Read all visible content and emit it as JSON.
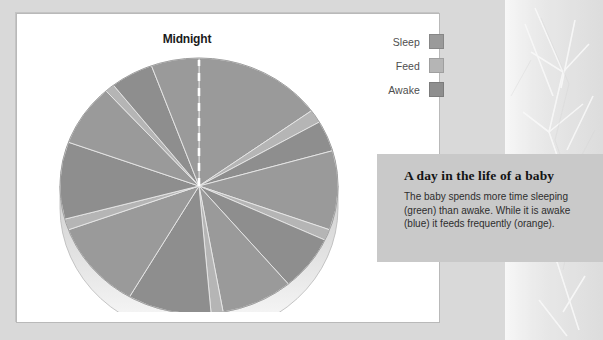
{
  "chart_panel": {
    "title": "Midnight"
  },
  "legend": {
    "items": [
      {
        "label": "Sleep",
        "color": "#9a9a9a",
        "icon": "legend-swatch-icon"
      },
      {
        "label": "Feed",
        "color": "#b5b5b5",
        "icon": "legend-swatch-icon"
      },
      {
        "label": "Awake",
        "color": "#8e8e8e",
        "icon": "legend-swatch-icon"
      }
    ]
  },
  "caption": {
    "title": "A day in the life of a baby",
    "body": "The baby spends more time sleeping (green) than awake. While it is awake (blue) it feeds frequently (orange)."
  },
  "colors": {
    "page_background": "#d9d9d9",
    "panel_background": "#ffffff",
    "panel_border": "#b9b9b9",
    "caption_background": "#c9c9c9",
    "sleep": "#9a9a9a",
    "feed": "#b5b5b5",
    "awake": "#8e8e8e",
    "pie_side": "#d4d4d4",
    "midnight_marker": "#ffffff",
    "text_dark": "#1b1b1b",
    "text_gray": "#4e4e4e"
  },
  "chart_data": {
    "type": "pie",
    "title": "Midnight",
    "subtitle": "A day in the life of a baby",
    "start_angle_deg": 0,
    "direction": "clockwise",
    "units": "hours of a 24 hour day",
    "total": 24,
    "annotations": [
      "Midnight"
    ],
    "legend_position": "top-right",
    "three_d": true,
    "categories": [
      "Sleep",
      "Feed",
      "Awake"
    ],
    "category_colors": [
      "#9a9a9a",
      "#b5b5b5",
      "#8e8e8e"
    ],
    "slices": [
      {
        "label": "Sleep",
        "category": "Sleep",
        "value": 3.6,
        "start_deg": 0,
        "end_deg": 54,
        "color": "#9a9a9a"
      },
      {
        "label": "Feed",
        "category": "Feed",
        "value": 0.4,
        "start_deg": 54,
        "end_deg": 60,
        "color": "#b5b5b5"
      },
      {
        "label": "Awake",
        "category": "Awake",
        "value": 0.93,
        "start_deg": 60,
        "end_deg": 74,
        "color": "#8e8e8e"
      },
      {
        "label": "Sleep",
        "category": "Sleep",
        "value": 2.4,
        "start_deg": 74,
        "end_deg": 110,
        "color": "#9a9a9a"
      },
      {
        "label": "Feed",
        "category": "Feed",
        "value": 0.33,
        "start_deg": 110,
        "end_deg": 115,
        "color": "#b5b5b5"
      },
      {
        "label": "Awake",
        "category": "Awake",
        "value": 1.67,
        "start_deg": 115,
        "end_deg": 140,
        "color": "#8e8e8e"
      },
      {
        "label": "Sleep",
        "category": "Sleep",
        "value": 2.0,
        "start_deg": 140,
        "end_deg": 170,
        "color": "#9a9a9a"
      },
      {
        "label": "Feed",
        "category": "Feed",
        "value": 0.33,
        "start_deg": 170,
        "end_deg": 175,
        "color": "#b5b5b5"
      },
      {
        "label": "Awake",
        "category": "Awake",
        "value": 2.33,
        "start_deg": 175,
        "end_deg": 210,
        "color": "#8e8e8e"
      },
      {
        "label": "Sleep",
        "category": "Sleep",
        "value": 2.67,
        "start_deg": 210,
        "end_deg": 250,
        "color": "#9a9a9a"
      },
      {
        "label": "Feed",
        "category": "Feed",
        "value": 0.33,
        "start_deg": 250,
        "end_deg": 255,
        "color": "#b5b5b5"
      },
      {
        "label": "Awake",
        "category": "Awake",
        "value": 2.33,
        "start_deg": 255,
        "end_deg": 290,
        "color": "#8e8e8e"
      },
      {
        "label": "Sleep",
        "category": "Sleep",
        "value": 1.87,
        "start_deg": 290,
        "end_deg": 318,
        "color": "#9a9a9a"
      },
      {
        "label": "Feed",
        "category": "Feed",
        "value": 0.27,
        "start_deg": 318,
        "end_deg": 322,
        "color": "#b5b5b5"
      },
      {
        "label": "Awake",
        "category": "Awake",
        "value": 1.2,
        "start_deg": 322,
        "end_deg": 340,
        "color": "#8e8e8e"
      },
      {
        "label": "Sleep",
        "category": "Sleep",
        "value": 1.33,
        "start_deg": 340,
        "end_deg": 360,
        "color": "#9a9a9a"
      }
    ]
  }
}
